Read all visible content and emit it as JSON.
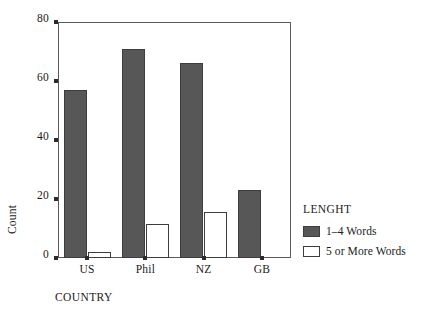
{
  "chart_data": {
    "type": "bar",
    "title": "",
    "subtitle": "",
    "xlabel": "COUNTRY",
    "ylabel": "Count",
    "categories": [
      "US",
      "Phil",
      "NZ",
      "GB"
    ],
    "series": [
      {
        "name": "1–4 Words",
        "color": "#575757",
        "values": [
          57,
          71,
          66,
          23
        ]
      },
      {
        "name": "5 or More Words",
        "color": "#ffffff",
        "values": [
          2,
          11.5,
          15.5,
          0
        ]
      }
    ],
    "ylim": [
      0,
      80
    ],
    "yticks": [
      0,
      20,
      40,
      60,
      80
    ],
    "ytick_labels": [
      "0",
      "20",
      "40",
      "60",
      "80"
    ],
    "grid": false,
    "legend": {
      "title": "LENGHT",
      "position": "right"
    },
    "frame": true,
    "grouping": "clustered"
  },
  "legend": {
    "title": "LENGHT",
    "entries": [
      {
        "label": "1–4 Words",
        "swatch": "dark-gray-filled"
      },
      {
        "label": "5 or More Words",
        "swatch": "white-outlined"
      }
    ]
  },
  "axes": {
    "y_title": "Count",
    "x_title": "COUNTRY"
  },
  "colors": {
    "series_1_fill": "#575757",
    "series_2_fill": "#ffffff",
    "bar_stroke": "#3d3d3d",
    "frame": "#5a5a5a",
    "text": "#1a1a1a"
  }
}
